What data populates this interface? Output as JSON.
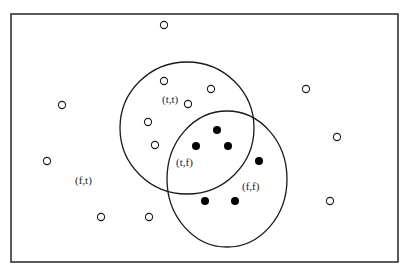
{
  "diagram": {
    "frame": {
      "x": 11,
      "y": 14,
      "width": 387,
      "height": 248,
      "stroke": "#333333"
    },
    "circles": [
      {
        "id": "circle-a",
        "cx": 187,
        "cy": 128,
        "rx": 67,
        "ry": 66
      },
      {
        "id": "circle-b",
        "cx": 227,
        "cy": 179,
        "rx": 60,
        "ry": 68
      }
    ],
    "labels": [
      {
        "text": "(t,t)",
        "x": 162,
        "y": 103
      },
      {
        "text": "(t,f)",
        "x": 176,
        "y": 166
      },
      {
        "text": "(f,f)",
        "x": 242,
        "y": 190
      },
      {
        "text": "(f,t)",
        "x": 75,
        "y": 184
      }
    ],
    "open_points": [
      {
        "x": 164,
        "y": 25
      },
      {
        "x": 62,
        "y": 105
      },
      {
        "x": 164,
        "y": 81
      },
      {
        "x": 211,
        "y": 89
      },
      {
        "x": 188,
        "y": 104
      },
      {
        "x": 148,
        "y": 122
      },
      {
        "x": 155,
        "y": 145
      },
      {
        "x": 306,
        "y": 89
      },
      {
        "x": 337,
        "y": 137
      },
      {
        "x": 47,
        "y": 161
      },
      {
        "x": 101,
        "y": 217
      },
      {
        "x": 149,
        "y": 217
      },
      {
        "x": 330,
        "y": 201
      }
    ],
    "filled_points": [
      {
        "x": 217,
        "y": 130
      },
      {
        "x": 196,
        "y": 146
      },
      {
        "x": 228,
        "y": 146
      },
      {
        "x": 259,
        "y": 161
      },
      {
        "x": 205,
        "y": 201
      },
      {
        "x": 235,
        "y": 201
      }
    ],
    "colors": {
      "stroke": "#1a1a1a",
      "fill_point": "#000000",
      "background": "#ffffff"
    }
  }
}
